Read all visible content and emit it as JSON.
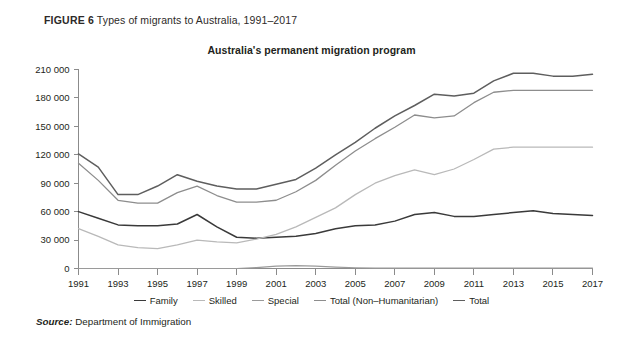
{
  "figure": {
    "number_label": "FIGURE 6",
    "caption": "Types of migrants to Australia, 1991–2017",
    "source_key": "Source:",
    "source_value": "Department of Immigration"
  },
  "colors": {
    "family": "#3a3a3a",
    "skilled": "#b9b9b9",
    "special": "#9a9a9a",
    "total_non_humanitarian": "#8d8d8d",
    "total": "#5e5e5e",
    "axis": "#8b8b8b",
    "text": "#231f20",
    "background": "#ffffff"
  },
  "legend": {
    "position": "bottom-center",
    "items": [
      {
        "label": "Family",
        "color": "#3a3a3a"
      },
      {
        "label": "Skilled",
        "color": "#b9b9b9"
      },
      {
        "label": "Special",
        "color": "#9a9a9a"
      },
      {
        "label": "Total (Non–Humanitarian)",
        "color": "#8d8d8d"
      },
      {
        "label": "Total",
        "color": "#5e5e5e"
      }
    ]
  },
  "chart_data": {
    "type": "line",
    "title": "Australia's permanent migration program",
    "xlabel": "",
    "ylabel": "",
    "grid": false,
    "legend_position": "bottom-center",
    "xlim": [
      1991,
      2017
    ],
    "ylim": [
      0,
      210000
    ],
    "ytick_values": [
      0,
      30000,
      60000,
      90000,
      120000,
      150000,
      180000,
      210000
    ],
    "ytick_labels": [
      "0",
      "30 000",
      "60 000",
      "90 000",
      "120 000",
      "150 000",
      "180 000",
      "210 000"
    ],
    "xtick_values": [
      1991,
      1993,
      1995,
      1997,
      1999,
      2001,
      2003,
      2005,
      2007,
      2009,
      2011,
      2013,
      2015,
      2017
    ],
    "xtick_labels": [
      "1991",
      "1993",
      "1995",
      "1997",
      "1999",
      "2001",
      "2003",
      "2005",
      "2007",
      "2009",
      "2011",
      "2013",
      "2015",
      "2017"
    ],
    "x": [
      1991,
      1992,
      1993,
      1994,
      1995,
      1996,
      1997,
      1998,
      1999,
      2000,
      2001,
      2002,
      2003,
      2004,
      2005,
      2006,
      2007,
      2008,
      2009,
      2010,
      2011,
      2012,
      2013,
      2014,
      2015,
      2016,
      2017
    ],
    "series": [
      {
        "name": "Family",
        "color": "#3a3a3a",
        "values": [
          60000,
          53000,
          46000,
          45000,
          45000,
          47000,
          57000,
          44000,
          33000,
          32000,
          33000,
          34000,
          37000,
          42000,
          45000,
          46000,
          50000,
          57000,
          59000,
          55000,
          55000,
          57000,
          59000,
          61000,
          58000,
          57000,
          56000
        ]
      },
      {
        "name": "Skilled",
        "color": "#b9b9b9",
        "values": [
          42000,
          34000,
          25000,
          22000,
          21000,
          25000,
          30000,
          28000,
          27000,
          31000,
          36000,
          44000,
          54000,
          64000,
          78000,
          90000,
          98000,
          104000,
          99000,
          105000,
          115000,
          126000,
          128000,
          128000,
          128000,
          128000,
          128000
        ]
      },
      {
        "name": "Special",
        "color": "#9a9a9a",
        "values": [
          0,
          0,
          0,
          0,
          0,
          0,
          0,
          0,
          0,
          1000,
          2500,
          3000,
          2500,
          1500,
          800,
          500,
          400,
          300,
          300,
          300,
          300,
          300,
          300,
          300,
          300,
          300,
          300
        ]
      },
      {
        "name": "Total (Non–Humanitarian)",
        "color": "#8d8d8d",
        "values": [
          111000,
          93000,
          72000,
          69000,
          69000,
          80000,
          87000,
          77000,
          70000,
          70000,
          72000,
          81000,
          93000,
          109000,
          124000,
          137000,
          149000,
          162000,
          159000,
          161000,
          175000,
          186000,
          188000,
          188000,
          188000,
          188000,
          188000
        ]
      },
      {
        "name": "Total",
        "color": "#5e5e5e",
        "values": [
          121000,
          107000,
          78000,
          78000,
          87000,
          99000,
          92000,
          87000,
          84000,
          84000,
          89000,
          94000,
          106000,
          120000,
          133000,
          148000,
          161000,
          172000,
          184000,
          182000,
          185000,
          198000,
          206000,
          206000,
          203000,
          203000,
          205000
        ]
      }
    ]
  }
}
